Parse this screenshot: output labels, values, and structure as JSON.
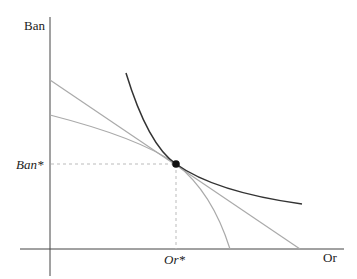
{
  "diagram": {
    "axes": {
      "y_label": "Ban",
      "x_label": "Or",
      "color": "#333333"
    },
    "equilibrium": {
      "x_label": "Or*",
      "y_label": "Ban*",
      "point": [
        176,
        164
      ],
      "guide_color": "#bbbbbb"
    },
    "curves": [
      {
        "name": "indifference-curve",
        "kind": "convex",
        "color": "#333333"
      },
      {
        "name": "straight-budget-line",
        "kind": "linear",
        "color": "#aaaaaa",
        "from": [
          50,
          80
        ],
        "to": [
          300,
          249
        ]
      },
      {
        "name": "production-possibility-frontier",
        "kind": "concave",
        "color": "#aaaaaa",
        "from": [
          50,
          115
        ],
        "to": [
          230,
          249
        ]
      }
    ]
  }
}
